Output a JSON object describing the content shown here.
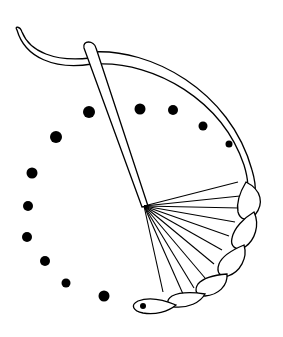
{
  "diagram": {
    "colors": {
      "stroke": "#000000",
      "fill": "#ffffff",
      "dot": "#000000"
    },
    "dots": [
      {
        "x": 89,
        "y": 112,
        "r": 6
      },
      {
        "x": 140,
        "y": 109,
        "r": 5.5
      },
      {
        "x": 173,
        "y": 110,
        "r": 5
      },
      {
        "x": 203,
        "y": 126,
        "r": 4.5
      },
      {
        "x": 229,
        "y": 144,
        "r": 3.5
      },
      {
        "x": 56,
        "y": 137,
        "r": 6
      },
      {
        "x": 32,
        "y": 173,
        "r": 5.5
      },
      {
        "x": 28,
        "y": 206,
        "r": 5
      },
      {
        "x": 27,
        "y": 237,
        "r": 5
      },
      {
        "x": 45,
        "y": 261,
        "r": 5
      },
      {
        "x": 66,
        "y": 283,
        "r": 4.5
      },
      {
        "x": 104,
        "y": 296,
        "r": 5.5
      }
    ],
    "fan_origin": {
      "x": 144,
      "y": 206
    },
    "fan_ends": [
      [
        238,
        182
      ],
      [
        240,
        196
      ],
      [
        239,
        208
      ],
      [
        235,
        222
      ],
      [
        229,
        236
      ],
      [
        222,
        250
      ],
      [
        214,
        264
      ],
      [
        205,
        278
      ],
      [
        194,
        288
      ],
      [
        183,
        294
      ],
      [
        163,
        292
      ]
    ]
  }
}
